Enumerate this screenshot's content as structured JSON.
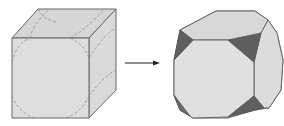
{
  "diagram": {
    "colors": {
      "background": "#ffffff",
      "face_fill": "#dcdcdc",
      "edge_stroke": "#666666",
      "dashed_stroke": "#8a8a8a",
      "corner_fill": "#5f5f5f",
      "arrow": "#222222"
    },
    "items": [
      {
        "name": "cube",
        "label": ""
      },
      {
        "name": "arrow",
        "label": ""
      },
      {
        "name": "truncated-cube",
        "label": ""
      }
    ]
  }
}
